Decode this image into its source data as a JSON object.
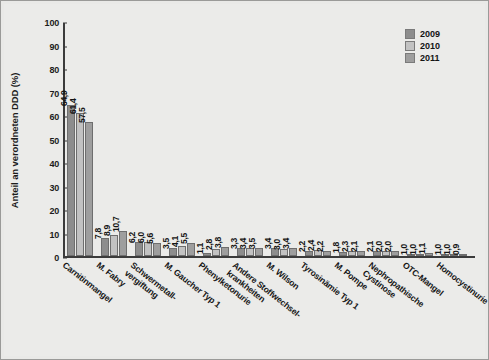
{
  "figure": {
    "background": "#e9e9e7",
    "frame_color": "#9a9a98"
  },
  "legend": {
    "position": "top-right",
    "entries": [
      {
        "label": "2009",
        "color": "#8d8d8d"
      },
      {
        "label": "2010",
        "color": "#c2c2c2"
      },
      {
        "label": "2011",
        "color": "#9e9e9e"
      }
    ]
  },
  "axes": {
    "ylabel": "Anteil an verordneten DDD (%)",
    "yticks": [
      "0",
      "10",
      "20",
      "30",
      "40",
      "50",
      "60",
      "70",
      "80",
      "90",
      "100"
    ],
    "ylim": [
      0,
      100
    ],
    "grid": false
  },
  "chart_data": {
    "type": "bar",
    "title": "",
    "xlabel": "",
    "ylabel": "Anteil an verordneten DDD (%)",
    "ylim": [
      0,
      100
    ],
    "grid": false,
    "legend_position": "top-right",
    "categories": [
      "Carnitinmangel",
      "M. Fabry",
      "Schwermetall-\nvergiftung",
      "M. Gaucher Typ 1",
      "Phenylketonurie",
      "Andere Stoffwechsel-\nkrankheiten",
      "M. Wilson",
      "Tyrosinämie Typ 1",
      "M. Pompe",
      "Nephropathische\nCystinose",
      "OTC-Mangel",
      "Homocystinurie"
    ],
    "series": [
      {
        "name": "2009",
        "color": "#8d8d8d",
        "values": [
          64.9,
          7.8,
          6.2,
          3.5,
          1.1,
          3.3,
          3.4,
          2.2,
          1.8,
          2.1,
          1.0,
          1.0
        ],
        "labels": [
          "64,9",
          "7,8",
          "6,2",
          "3,5",
          "1,1",
          "3,3",
          "3,4",
          "2,2",
          "1,8",
          "2,1",
          "1,0",
          "1,0"
        ]
      },
      {
        "name": "2010",
        "color": "#c2c2c2",
        "values": [
          61.4,
          8.9,
          6.0,
          4.1,
          2.8,
          3.4,
          3.0,
          2.4,
          2.3,
          2.0,
          1.0,
          1.0
        ],
        "labels": [
          "61,4",
          "8,9",
          "6,0",
          "4,1",
          "2,8",
          "3,4",
          "3,0",
          "2,4",
          "2,3",
          "2,0",
          "1,0",
          "1,0"
        ]
      },
      {
        "name": "2011",
        "color": "#9e9e9e",
        "values": [
          57.5,
          10.7,
          5.6,
          5.5,
          3.8,
          3.5,
          3.4,
          2.2,
          2.1,
          2.0,
          1.1,
          0.9
        ],
        "labels": [
          "57,5",
          "10,7",
          "5,6",
          "5,5",
          "3,8",
          "3,5",
          "3,4",
          "2,2",
          "2,1",
          "2,0",
          "1,1",
          "0,9"
        ]
      }
    ]
  }
}
